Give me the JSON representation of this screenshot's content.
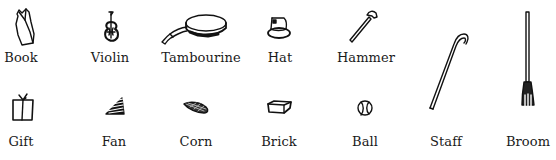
{
  "items": [
    {
      "id": "book",
      "label": "Book",
      "icon": "book-icon"
    },
    {
      "id": "violin",
      "label": "Violin",
      "icon": "violin-icon"
    },
    {
      "id": "tambourine",
      "label": "Tambourine",
      "icon": "tambourine-icon"
    },
    {
      "id": "hat",
      "label": "Hat",
      "icon": "hat-icon"
    },
    {
      "id": "hammer",
      "label": "Hammer",
      "icon": "hammer-icon"
    },
    {
      "id": "staff",
      "label": "Staff",
      "icon": "staff-icon"
    },
    {
      "id": "broom",
      "label": "Broom",
      "icon": "broom-icon"
    },
    {
      "id": "gift",
      "label": "Gift",
      "icon": "gift-icon"
    },
    {
      "id": "fan",
      "label": "Fan",
      "icon": "fan-icon"
    },
    {
      "id": "corn",
      "label": "Corn",
      "icon": "corn-icon"
    },
    {
      "id": "brick",
      "label": "Brick",
      "icon": "brick-icon"
    },
    {
      "id": "ball",
      "label": "Ball",
      "icon": "ball-icon"
    }
  ]
}
